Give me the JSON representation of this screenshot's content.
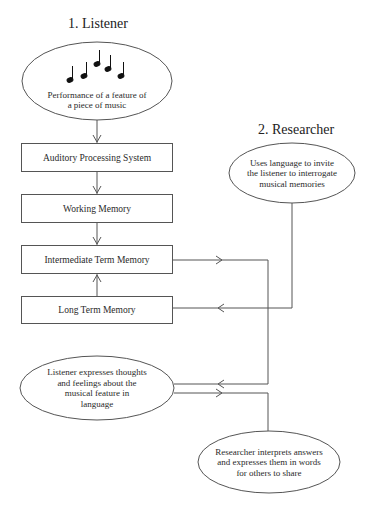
{
  "headings": {
    "listener": "1. Listener",
    "researcher": "2. Researcher"
  },
  "listener_column": {
    "performance_ellipse": {
      "icon": "music-notes-icon",
      "lines": [
        "Performance of a feature of",
        "a piece of music"
      ]
    },
    "boxes": [
      {
        "id": "auditory",
        "label": "Auditory Processing System"
      },
      {
        "id": "working",
        "label": "Working Memory"
      },
      {
        "id": "intermediate",
        "label": "Intermediate Term Memory"
      },
      {
        "id": "longterm",
        "label": "Long Term Memory"
      }
    ],
    "expression_ellipse": {
      "lines": [
        "Listener  expresses thoughts",
        "and feelings about the",
        "musical feature in",
        "language"
      ]
    }
  },
  "researcher_column": {
    "invite_ellipse": {
      "lines": [
        "Uses language to invite",
        "the listener to interrogate",
        "musical memories"
      ]
    },
    "interpret_ellipse": {
      "lines": [
        "Researcher interprets answers",
        "and expresses them in words",
        "for others to share"
      ]
    }
  },
  "colors": {
    "line": "#555555",
    "text": "#2a2a2a",
    "background": "#ffffff"
  }
}
